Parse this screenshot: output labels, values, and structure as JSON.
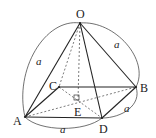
{
  "figure": {
    "type": "square pyramid",
    "points": {
      "O": {
        "label": "O",
        "x": 80,
        "y": 23,
        "lx": 76,
        "ly": 18
      },
      "A": {
        "label": "A",
        "x": 25,
        "y": 117,
        "lx": 13,
        "ly": 125
      },
      "B": {
        "label": "B",
        "x": 136,
        "y": 87,
        "lx": 140,
        "ly": 92
      },
      "C": {
        "label": "C",
        "x": 59,
        "y": 87,
        "lx": 49,
        "ly": 90
      },
      "D": {
        "label": "D",
        "x": 102,
        "y": 118,
        "lx": 99,
        "ly": 133
      },
      "E": {
        "label": "E",
        "x": 78,
        "y": 101,
        "lx": 74,
        "ly": 116
      }
    },
    "edge_labels": [
      {
        "text": "a",
        "x": 36,
        "y": 65,
        "edge": "OA"
      },
      {
        "text": "a",
        "x": 114,
        "y": 48,
        "edge": "OB"
      },
      {
        "text": "a",
        "x": 124,
        "y": 112,
        "edge": "BD"
      },
      {
        "text": "a",
        "x": 60,
        "y": 133,
        "edge": "AD"
      }
    ],
    "right_angle_mark": {
      "at": "E"
    }
  }
}
